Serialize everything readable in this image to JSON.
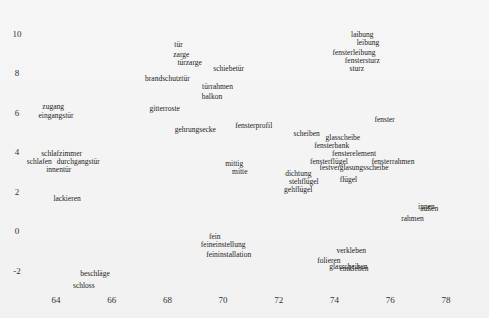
{
  "chart_data": {
    "type": "scatter",
    "title": "",
    "xlabel": "",
    "ylabel": "",
    "xlim": [
      63,
      79
    ],
    "ylim": [
      -3.2,
      10.8
    ],
    "grid": false,
    "legend": null,
    "xticks": [
      64,
      66,
      68,
      70,
      72,
      74,
      76,
      78
    ],
    "yticks": [
      10,
      8,
      6,
      4,
      2,
      0,
      -2
    ],
    "points": [
      {
        "label": "tür",
        "x": 68.4,
        "y": 9.4
      },
      {
        "label": "zarge",
        "x": 68.5,
        "y": 8.9
      },
      {
        "label": "türzarge",
        "x": 68.8,
        "y": 8.5
      },
      {
        "label": "schiebetür",
        "x": 70.2,
        "y": 8.2
      },
      {
        "label": "brandschutztür",
        "x": 68.0,
        "y": 7.7
      },
      {
        "label": "türrahmen",
        "x": 69.8,
        "y": 7.3
      },
      {
        "label": "balkon",
        "x": 69.6,
        "y": 6.8
      },
      {
        "label": "gitterroste",
        "x": 67.9,
        "y": 6.2
      },
      {
        "label": "zugang",
        "x": 63.9,
        "y": 6.3
      },
      {
        "label": "eingangstür",
        "x": 64.0,
        "y": 5.8
      },
      {
        "label": "gehrungsecke",
        "x": 69.0,
        "y": 5.1
      },
      {
        "label": "fensterprofil",
        "x": 71.1,
        "y": 5.3
      },
      {
        "label": "laibung",
        "x": 75.0,
        "y": 9.9
      },
      {
        "label": "leibung",
        "x": 75.2,
        "y": 9.5
      },
      {
        "label": "fensterleibung",
        "x": 74.7,
        "y": 9.0
      },
      {
        "label": "fenstersturz",
        "x": 75.0,
        "y": 8.6
      },
      {
        "label": "sturz",
        "x": 74.8,
        "y": 8.2
      },
      {
        "label": "fenster",
        "x": 75.8,
        "y": 5.6
      },
      {
        "label": "scheiben",
        "x": 73.0,
        "y": 4.9
      },
      {
        "label": "glasscheibe",
        "x": 74.3,
        "y": 4.7
      },
      {
        "label": "fensterbank",
        "x": 73.9,
        "y": 4.3
      },
      {
        "label": "fensterelement",
        "x": 74.7,
        "y": 3.9
      },
      {
        "label": "fensterflügel",
        "x": 73.8,
        "y": 3.5
      },
      {
        "label": "fensterrahmen",
        "x": 76.1,
        "y": 3.5
      },
      {
        "label": "festverglasungsscheibe",
        "x": 74.7,
        "y": 3.2
      },
      {
        "label": "dichtung",
        "x": 72.7,
        "y": 2.9
      },
      {
        "label": "stehflügel",
        "x": 72.9,
        "y": 2.5
      },
      {
        "label": "gehflügel",
        "x": 72.7,
        "y": 2.1
      },
      {
        "label": "flügel",
        "x": 74.5,
        "y": 2.6
      },
      {
        "label": "mittig",
        "x": 70.4,
        "y": 3.4
      },
      {
        "label": "mitte",
        "x": 70.6,
        "y": 3.0
      },
      {
        "label": "schlafzimmer",
        "x": 64.2,
        "y": 3.9
      },
      {
        "label": "durchgangstür",
        "x": 64.8,
        "y": 3.5
      },
      {
        "label": "schlafen",
        "x": 63.4,
        "y": 3.5
      },
      {
        "label": "innentür",
        "x": 64.1,
        "y": 3.1
      },
      {
        "label": "lackieren",
        "x": 64.4,
        "y": 1.6
      },
      {
        "label": "innen",
        "x": 77.3,
        "y": 1.2
      },
      {
        "label": "außen",
        "x": 77.4,
        "y": 1.1
      },
      {
        "label": "rahmen",
        "x": 76.8,
        "y": 0.6
      },
      {
        "label": "fein",
        "x": 69.7,
        "y": -0.3
      },
      {
        "label": "feineinstellung",
        "x": 70.0,
        "y": -0.7
      },
      {
        "label": "feininstallation",
        "x": 70.2,
        "y": -1.2
      },
      {
        "label": "verkleben",
        "x": 74.6,
        "y": -1.0
      },
      {
        "label": "folieren",
        "x": 73.8,
        "y": -1.5
      },
      {
        "label": "glasscheiben",
        "x": 74.5,
        "y": -1.8
      },
      {
        "label": "einkleben",
        "x": 74.7,
        "y": -1.9
      },
      {
        "label": "beschläge",
        "x": 65.4,
        "y": -2.2
      },
      {
        "label": "schloss",
        "x": 65.0,
        "y": -2.8
      }
    ]
  },
  "layout": {
    "x0_value": 64,
    "x0_px": 56,
    "x_px_per_unit": 27.85,
    "y0_value": 0,
    "y0_px": 231,
    "y_px_per_unit": 19.75,
    "xtick_row_px": 300,
    "ytick_col_px": 17
  }
}
